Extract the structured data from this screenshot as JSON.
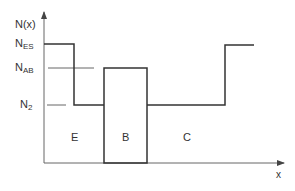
{
  "diagram": {
    "y_axis_label": "N(x)",
    "x_axis_label": "x",
    "levels": [
      {
        "name": "N",
        "sub": "ES"
      },
      {
        "name": "N",
        "sub": "AB"
      },
      {
        "name": "N",
        "sub": "2"
      }
    ],
    "regions": [
      "E",
      "B",
      "C"
    ],
    "colors": {
      "line": "#333333",
      "axis": "#555555"
    }
  }
}
